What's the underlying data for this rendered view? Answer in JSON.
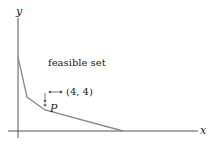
{
  "axes": {
    "x_label": "x",
    "y_label": "y"
  },
  "region_label": "feasible set",
  "point_p": {
    "label": "P"
  },
  "point_44": {
    "label": "(4, 4)"
  },
  "boundary_vertices": [
    [
      18,
      57
    ],
    [
      27,
      97
    ],
    [
      45,
      110
    ],
    [
      123,
      131
    ]
  ],
  "colors": {
    "line": "#8a8a8a",
    "axis": "#444444",
    "text": "#222222"
  }
}
